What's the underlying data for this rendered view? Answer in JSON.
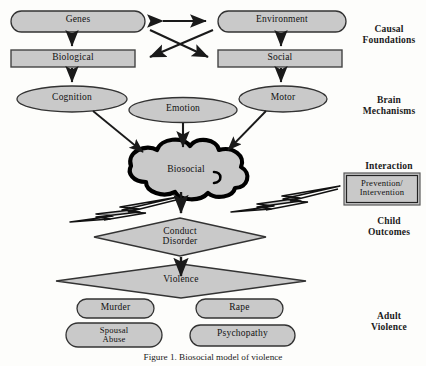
{
  "figure": {
    "caption": "Figure 1. Biosocial model of violence",
    "colors": {
      "node_fill": "#c9c9c9",
      "node_stroke": "#333333",
      "cloud_stroke": "#000000",
      "arrow": "#1a1a1a",
      "background": "#fdfdfb"
    }
  },
  "stage_labels": [
    {
      "id": "causal-foundations",
      "lines": [
        "Causal",
        "Foundations"
      ],
      "x": 352,
      "y": 24
    },
    {
      "id": "brain-mechanisms",
      "lines": [
        "Brain",
        "Mechanisms"
      ],
      "x": 352,
      "y": 95
    },
    {
      "id": "interaction",
      "lines": [
        "Interaction"
      ],
      "x": 352,
      "y": 161
    },
    {
      "id": "child-outcomes",
      "lines": [
        "Child",
        "Outcomes"
      ],
      "x": 352,
      "y": 216
    },
    {
      "id": "adult-violence",
      "lines": [
        "Adult",
        "Violence"
      ],
      "x": 352,
      "y": 311
    }
  ],
  "nodes": {
    "genes": {
      "label": "Genes",
      "shape": "pill"
    },
    "environment": {
      "label": "Environment",
      "shape": "pill"
    },
    "biological": {
      "label": "Biological",
      "shape": "rect"
    },
    "social": {
      "label": "Social",
      "shape": "rect"
    },
    "cognition": {
      "label": "Cognition",
      "shape": "ellipse"
    },
    "emotion": {
      "label": "Emotion",
      "shape": "ellipse"
    },
    "motor": {
      "label": "Motor",
      "shape": "ellipse"
    },
    "biosocial": {
      "label": "Biosocial",
      "shape": "cloud"
    },
    "prevention": {
      "label_line1": "Prevention/",
      "label_line2": "Intervention",
      "shape": "rect-double"
    },
    "conduct_disorder": {
      "label_line1": "Conduct",
      "label_line2": "Disorder",
      "shape": "diamond"
    },
    "violence": {
      "label": "Violence",
      "shape": "diamond"
    },
    "murder": {
      "label": "Murder",
      "shape": "pill"
    },
    "rape": {
      "label": "Rape",
      "shape": "pill"
    },
    "spousal_abuse": {
      "label_line1": "Spousal",
      "label_line2": "Abuse",
      "shape": "pill"
    },
    "psychopathy": {
      "label": "Psychopathy",
      "shape": "pill"
    }
  }
}
